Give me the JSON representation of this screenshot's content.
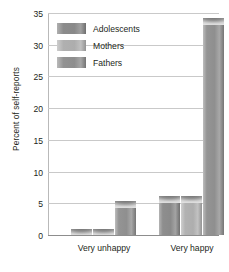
{
  "chart_data": {
    "type": "bar",
    "title": "",
    "xlabel": "",
    "ylabel": "Percent of self-reports",
    "categories": [
      "Very unhappy",
      "Very happy"
    ],
    "series": [
      {
        "name": "Adolescents",
        "values": [
          1.0,
          6.2
        ],
        "color": "#8b8b8b"
      },
      {
        "name": "Mothers",
        "values": [
          1.0,
          6.2
        ],
        "color": "#b0b0b0"
      },
      {
        "name": "Fathers",
        "values": [
          5.3,
          34.2
        ],
        "color": "#929292"
      }
    ],
    "ylim": [
      0,
      35
    ],
    "yticks": [
      0,
      5,
      10,
      15,
      20,
      25,
      30,
      35
    ],
    "ytick_labels": [
      "0",
      "5",
      "10",
      "15",
      "20",
      "25",
      "30",
      "35"
    ],
    "grid": true,
    "grid_axis": "y",
    "legend_position": "upper-left-inside",
    "background": "#ffffff",
    "grid_color": "#c9c9c9",
    "text_color": "#231f20"
  }
}
